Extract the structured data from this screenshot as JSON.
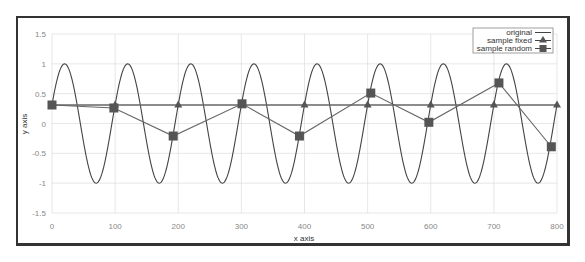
{
  "chart_data": {
    "type": "line",
    "title": "",
    "xlabel": "x axis",
    "ylabel": "y axis",
    "xlim": [
      0,
      800
    ],
    "ylim": [
      -1.5,
      1.5
    ],
    "grid": true,
    "legend_position": "top-right",
    "x_ticks": [
      "0",
      "100",
      "200",
      "300",
      "400",
      "500",
      "600",
      "700",
      "800"
    ],
    "y_ticks": [
      "1.5",
      "1",
      "0.5",
      "0",
      "-0.5",
      "-1",
      "-1.5"
    ],
    "series": [
      {
        "name": "original",
        "kind": "function",
        "formula": "sin(2*pi*x/100 + 0.32)",
        "marker": "none"
      },
      {
        "name": "sample fixed",
        "marker": "triangle",
        "x": [
          0,
          100,
          200,
          300,
          400,
          500,
          600,
          700,
          800
        ],
        "y": [
          0.31,
          0.31,
          0.31,
          0.31,
          0.31,
          0.31,
          0.31,
          0.31,
          0.31
        ]
      },
      {
        "name": "sample random",
        "marker": "square",
        "x": [
          0,
          98,
          192,
          301,
          392,
          505,
          597,
          708,
          791
        ],
        "y": [
          0.31,
          0.26,
          -0.21,
          0.33,
          -0.21,
          0.51,
          0.02,
          0.68,
          -0.39
        ]
      }
    ]
  },
  "legend": {
    "items": [
      "original",
      "sample fixed",
      "sample random"
    ]
  },
  "axes": {
    "xlabel": "x axis",
    "ylabel": "y axis"
  },
  "colors": {
    "line": "#444444",
    "marker": "#555555",
    "grid": "#dddddd",
    "tick": "#888888"
  }
}
